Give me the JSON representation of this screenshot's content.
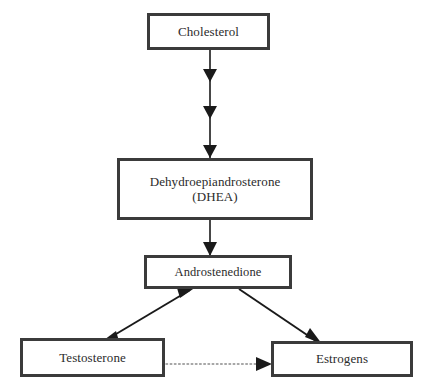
{
  "diagram": {
    "background_color": "#ffffff",
    "box_border_color": "#3b3b3b",
    "text_color": "#2b2b2b",
    "arrow_color": "#1a1a1a",
    "nodes": [
      {
        "id": "cholesterol",
        "label": "Cholesterol",
        "x": 147,
        "y": 13,
        "width": 123,
        "height": 37
      },
      {
        "id": "dhea",
        "label": "Dehydroepiandrosterone\n(DHEA)",
        "x": 117,
        "y": 158,
        "width": 196,
        "height": 62
      },
      {
        "id": "androstenedione",
        "label": "Androstenedione",
        "x": 144,
        "y": 255,
        "width": 148,
        "height": 34
      },
      {
        "id": "testosterone",
        "label": "Testosterone",
        "x": 20,
        "y": 338,
        "width": 145,
        "height": 39
      },
      {
        "id": "estrogens",
        "label": "Estrogens",
        "x": 271,
        "y": 341,
        "width": 142,
        "height": 36
      }
    ],
    "edges": [
      {
        "id": "cholesterol-to-dhea",
        "from": "cholesterol",
        "to": "dhea",
        "style": "solid",
        "direction": "down",
        "arrowheads": 3
      },
      {
        "id": "dhea-to-androstenedione",
        "from": "dhea",
        "to": "androstenedione",
        "style": "solid",
        "direction": "down",
        "arrowheads": 1
      },
      {
        "id": "androstenedione-testosterone",
        "from": "androstenedione",
        "to": "testosterone",
        "style": "solid",
        "direction": "bidirectional",
        "arrowheads": 2
      },
      {
        "id": "androstenedione-to-estrogens",
        "from": "androstenedione",
        "to": "estrogens",
        "style": "solid",
        "direction": "down-right",
        "arrowheads": 1
      },
      {
        "id": "testosterone-to-estrogens",
        "from": "testosterone",
        "to": "estrogens",
        "style": "dotted",
        "direction": "right",
        "arrowheads": 1
      }
    ]
  }
}
